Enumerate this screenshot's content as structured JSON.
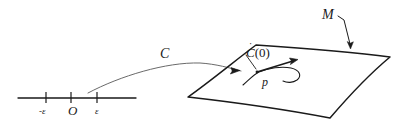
{
  "figure": {
    "stroke_color": "#1a1a1a",
    "curve_color": "#555555",
    "background": "#ffffff"
  },
  "labels": {
    "manifold": "M",
    "curve": "C",
    "tangent_vector_base": "C",
    "tangent_vector_dot": "˙",
    "tangent_vector_arg": "(0)",
    "point": "p",
    "axis_epsilon_negative": "-ε",
    "axis_origin": "O",
    "axis_epsilon_positive": "ε"
  },
  "number_line": {
    "y": 98,
    "x_start": 18,
    "x_end": 136,
    "ticks": [
      {
        "name": "epsilon-negative",
        "x": 46,
        "label": "-ε"
      },
      {
        "name": "origin",
        "x": 71,
        "label": "O"
      },
      {
        "name": "epsilon-positive",
        "x": 97,
        "label": "ε"
      }
    ]
  },
  "surface": {
    "name": "manifold-patch",
    "vertices": [
      {
        "name": "top",
        "x": 256,
        "y": 45
      },
      {
        "name": "right",
        "x": 390,
        "y": 57
      },
      {
        "name": "bottom",
        "x": 330,
        "y": 118
      },
      {
        "name": "left",
        "x": 188,
        "y": 97
      }
    ]
  },
  "annotations": {
    "m_leader_from": {
      "x": 339,
      "y": 18
    },
    "m_leader_to": {
      "x": 350,
      "y": 48
    },
    "curve_start": {
      "x": 88,
      "y": 93
    },
    "curve_end": {
      "x": 240,
      "y": 70
    },
    "tangent_from": {
      "x": 258,
      "y": 72
    },
    "tangent_to": {
      "x": 296,
      "y": 60
    }
  }
}
